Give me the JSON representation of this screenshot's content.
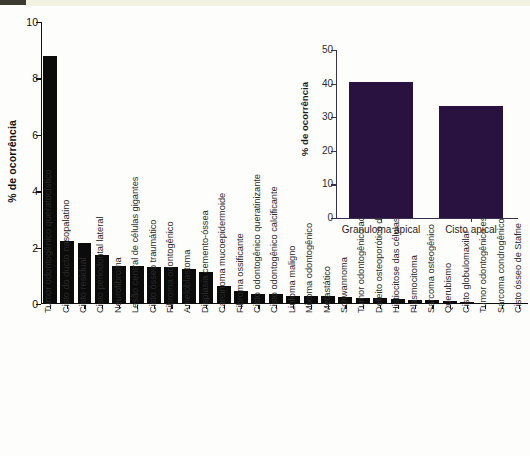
{
  "figure": {
    "background": "#fdfdfb",
    "bar_color_main": "#0b0b0b",
    "bar_color_inset": "#2a1240",
    "axis_color_main": "#111111",
    "axis_color_inset": "#3a3050"
  },
  "chart_data": [
    {
      "id": "main",
      "type": "bar",
      "title": "",
      "xlabel": "",
      "ylabel": "% de ocorrência",
      "ylim": [
        0,
        10
      ],
      "yticks": [
        0,
        2,
        4,
        6,
        8,
        10
      ],
      "ytick_labels": [
        "0",
        "2",
        "4",
        "6",
        "8",
        "10"
      ],
      "grid": false,
      "legend": "none",
      "categories": [
        "Tumor odontogênico queratocístico",
        "Cisto do ducto nasopalatino",
        "Cisto residual",
        "Cisto periodontal lateral",
        "Neurofibroma",
        "Lesão central de células gigantes",
        "Cisto ósseo traumático",
        "Fibroma odontogênico",
        "Ameloblastoma",
        "Displasia cemento-óssea",
        "Carcinoma mucoepidermoide",
        "Fibroma ossificante",
        "Cisto odontogênico queratinizante",
        "Cisto odontogênico calcificante",
        "Linfoma maligno",
        "Mixoma odontogênico",
        "Metastático",
        "Schwannoma",
        "Tumor odontogênico adenomatoide",
        "Defeito osteoporótico da medula óssea",
        "Histiocitose das células de Langerhans",
        "Plasmocitoma",
        "Sarcoma osteogênico",
        "Querubismo",
        "Cisto globulomaxilar",
        "Tumor odontogênico escamoso",
        "Sarcoma condrogênico",
        "Cisto ósseo de Stafne"
      ],
      "values": [
        8.8,
        2.25,
        2.15,
        1.75,
        1.35,
        1.35,
        1.3,
        1.3,
        1.25,
        1.15,
        0.65,
        0.45,
        0.35,
        0.35,
        0.3,
        0.3,
        0.28,
        0.25,
        0.22,
        0.2,
        0.18,
        0.15,
        0.13,
        0.1,
        0.07,
        0.05,
        0.04,
        0.03
      ]
    },
    {
      "id": "inset",
      "type": "bar",
      "title": "",
      "xlabel": "",
      "ylabel": "% de ocorrência",
      "ylim": [
        0,
        50
      ],
      "yticks": [
        0,
        10,
        20,
        30,
        40,
        50
      ],
      "ytick_labels": [
        "0",
        "10",
        "20",
        "30",
        "40",
        "50"
      ],
      "grid": false,
      "legend": "none",
      "categories": [
        "Granuloma apical",
        "Cisto apical"
      ],
      "values": [
        40.5,
        33.2
      ]
    }
  ]
}
